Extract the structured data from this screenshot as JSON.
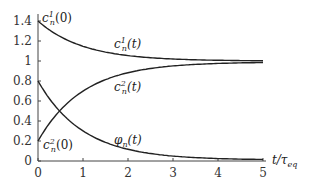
{
  "chart_data": {
    "type": "line",
    "title": "",
    "xlabel": "t/τ_eq",
    "ylabel": "",
    "xlim": [
      0,
      5
    ],
    "ylim": [
      0,
      1.4
    ],
    "grid": false,
    "legend": "inline curve labels",
    "x_ticks": [
      "0",
      "1",
      "2",
      "3",
      "4",
      "5"
    ],
    "y_ticks": [
      "0",
      "0.2",
      "0.4",
      "0.6",
      "0.8",
      "1",
      "1.2",
      "1.4"
    ],
    "x": [
      0,
      0.25,
      0.5,
      0.75,
      1,
      1.5,
      2,
      2.5,
      3,
      3.5,
      4,
      4.5,
      5
    ],
    "series": [
      {
        "name": "c_n^1(t)",
        "values": [
          1.4,
          1.31,
          1.24,
          1.19,
          1.15,
          1.09,
          1.05,
          1.03,
          1.02,
          1.01,
          1.01,
          1.0,
          1.0
        ]
      },
      {
        "name": "c_n^2(t)",
        "values": [
          0.2,
          0.38,
          0.51,
          0.62,
          0.71,
          0.82,
          0.89,
          0.93,
          0.96,
          0.98,
          0.99,
          0.99,
          0.99
        ]
      },
      {
        "name": "φ_n(t)",
        "values": [
          0.8,
          0.62,
          0.49,
          0.38,
          0.29,
          0.18,
          0.11,
          0.07,
          0.04,
          0.02,
          0.01,
          0.01,
          0.01
        ]
      }
    ],
    "annotations": [
      {
        "text": "c_n^1(0)",
        "x": 0,
        "y": 1.4
      },
      {
        "text": "c_n^2(0)",
        "x": 0,
        "y": 0.2
      },
      {
        "text": "c_n^1(t)",
        "x": 1.7,
        "y": 1.15
      },
      {
        "text": "c_n^2(t)",
        "x": 1.7,
        "y": 0.78
      },
      {
        "text": "φ_n(t)",
        "x": 1.7,
        "y": 0.28
      }
    ]
  },
  "labels": {
    "c1_0_base": "c",
    "c1_0_sup": "1",
    "c1_0_sub": "n",
    "c1_0_arg": "(0)",
    "c2_0_base": "c",
    "c2_0_sup": "2",
    "c2_0_sub": "n",
    "c2_0_arg": "(0)",
    "c1_t_base": "c",
    "c1_t_sup": "1",
    "c1_t_sub": "n",
    "c1_t_arg": "(t)",
    "c2_t_base": "c",
    "c2_t_sup": "2",
    "c2_t_sub": "n",
    "c2_t_arg": "(t)",
    "phi_base": "φ",
    "phi_sub": "n",
    "phi_arg": "(t)",
    "xaxis_main": "t/τ",
    "xaxis_sub": "eq"
  }
}
